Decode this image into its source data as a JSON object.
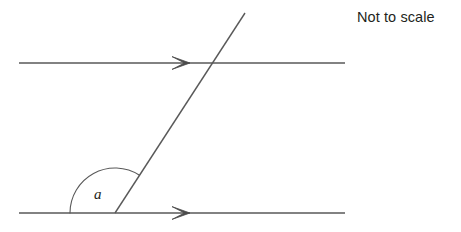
{
  "figure": {
    "note": "Not to scale",
    "angle_label": "a",
    "colors": {
      "line": "#595959",
      "arc": "#595959",
      "text": "#231f20",
      "background": "#ffffff"
    },
    "lines": [
      {
        "name": "top-parallel-line",
        "x1": 19,
        "y1": 63,
        "x2": 345,
        "y2": 63,
        "arrow_marker": "single-right-arrow",
        "arrow_at_x": 190
      },
      {
        "name": "bottom-parallel-line",
        "x1": 19,
        "y1": 213,
        "x2": 345,
        "y2": 213,
        "arrow_marker": "single-right-arrow",
        "arrow_at_x": 190
      },
      {
        "name": "transversal-line",
        "x1": 115,
        "y1": 213,
        "x2": 245,
        "y2": 13,
        "arrow_marker": "none"
      }
    ],
    "intersections": [
      {
        "name": "transversal-top-line",
        "x": 205,
        "y": 64
      },
      {
        "name": "transversal-bottom-line",
        "x": 115,
        "y": 213
      }
    ],
    "angle_arc": {
      "name": "angle-a-arc",
      "vertex_x": 115,
      "vertex_y": 213,
      "radius": 45,
      "start_x": 70,
      "start_y": 213,
      "end_x": 129,
      "end_y": 178,
      "apex_y": 172,
      "type": "obtuse"
    }
  }
}
